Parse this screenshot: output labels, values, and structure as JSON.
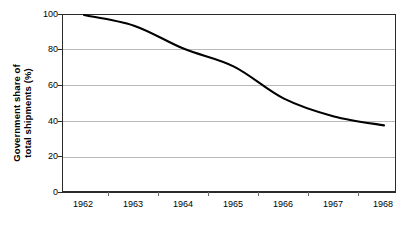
{
  "chart_data": {
    "type": "line",
    "title": "",
    "subtitle": "",
    "xlabel": "",
    "ylabel": "Government share of total shipments (%)",
    "ylabel_lines": [
      "Government share of",
      "total shipments (%)"
    ],
    "categories": [
      "1962",
      "1963",
      "1964",
      "1965",
      "1966",
      "1967",
      "1968"
    ],
    "x": [
      1962,
      1963,
      1964,
      1965,
      1966,
      1967,
      1968
    ],
    "values": [
      100,
      94,
      81,
      71,
      53,
      43,
      38
    ],
    "series": [
      {
        "name": "Government share of total shipments",
        "values": [
          100,
          94,
          81,
          71,
          53,
          43,
          38
        ],
        "color": "#000000"
      }
    ],
    "ylim": [
      0,
      100
    ],
    "yticks": [
      0,
      20,
      40,
      60,
      80,
      100
    ],
    "ytick_labels": [
      "0",
      "20",
      "40",
      "60",
      "80",
      "100"
    ],
    "xtick_labels": [
      "1962",
      "1963",
      "1964",
      "1965",
      "1966",
      "1967",
      "1968"
    ],
    "grid": true,
    "grid_axis": "y",
    "legend": false,
    "legend_position": "none",
    "annotations": [],
    "line_style": "solid",
    "markers": "none",
    "background_color": "#ffffff",
    "grid_color": "#b9b9b9",
    "axis_color": "#2b2b2b",
    "line_color": "#000000"
  }
}
